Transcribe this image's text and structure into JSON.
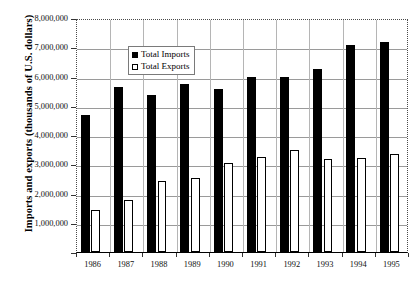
{
  "chart_data": {
    "type": "bar",
    "title": "",
    "xlabel": "",
    "ylabel": "Imports and exports (thousands of U.S. dollars)",
    "categories": [
      "1986",
      "1987",
      "1988",
      "1989",
      "1990",
      "1991",
      "1992",
      "1993",
      "1994",
      "1995"
    ],
    "series": [
      {
        "name": "Total Imports",
        "color": "#000000",
        "style": "filled",
        "values": [
          4700000,
          5650000,
          5380000,
          5730000,
          5570000,
          6000000,
          6000000,
          6250000,
          7090000,
          7190000
        ]
      },
      {
        "name": "Total Exports",
        "color": "#ffffff",
        "style": "hollow",
        "values": [
          1420000,
          1770000,
          2440000,
          2530000,
          3030000,
          3250000,
          3500000,
          3180000,
          3220000,
          3350000
        ]
      }
    ],
    "ylim": [
      0,
      8000000
    ],
    "ytick_values": [
      1000000,
      2000000,
      3000000,
      4000000,
      5000000,
      6000000,
      7000000,
      8000000
    ],
    "ytick_labels": [
      "1,000,000",
      "2,000,000",
      "3,000,000",
      "4,000,000",
      "5,000,000",
      "6,000,000",
      "7,000,000",
      "8,000,000"
    ],
    "grid": true,
    "legend_position": "top-left-inside"
  },
  "legend": {
    "items": [
      {
        "label": "Total Imports",
        "swatch": "filled-square-icon"
      },
      {
        "label": "Total Exports",
        "swatch": "hollow-square-icon"
      }
    ]
  }
}
